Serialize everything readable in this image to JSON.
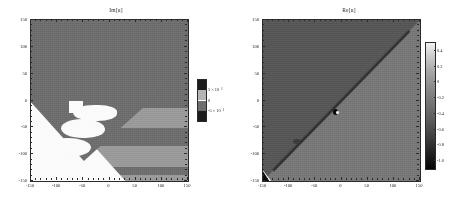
{
  "figure": {
    "background": "#ffffff",
    "panel_count": 2
  },
  "chart_data": [
    {
      "type": "heatmap",
      "title": "Im[u]",
      "xlabel": "",
      "ylabel": "",
      "xlim": [
        -150,
        150
      ],
      "ylim": [
        -150,
        150
      ],
      "xticks": [
        -150,
        -100,
        -50,
        0,
        50,
        100,
        150
      ],
      "yticks": [
        -150,
        -100,
        -50,
        0,
        50,
        100,
        150
      ],
      "xticklabels": [
        "-150",
        "-100",
        "-50",
        "0",
        "50",
        "100",
        "150"
      ],
      "yticklabels": [
        "-150",
        "-100",
        "-50",
        "0",
        "50",
        "100",
        "150"
      ],
      "grid": false,
      "colormap": "grayscale",
      "colorbar": {
        "position": "right",
        "discrete": true,
        "ticklabels": [
          "5 × 10⁻⁶",
          "0",
          "-5 × 10⁻⁶"
        ],
        "tickvalues": [
          5e-06,
          0,
          -5e-06
        ],
        "segments": [
          "#1c1c1c",
          "#b4b4b4",
          "#6e6e6e",
          "#1c1c1c"
        ]
      },
      "zlim": [
        -5e-06,
        5e-06
      ],
      "description": "Imaginary part of u: mostly uniform mid-gray background with a bright white diagonal stripe running lower-left to upper-right, lighter horizontal bands in the lower half, and lobed white islands along the diagonal below y = -10.",
      "regions": [
        {
          "name": "background",
          "value": 0,
          "color": "#6e6e6e"
        },
        {
          "name": "white-diagonal-stripe",
          "value": 5e-06,
          "color": "#fbfbfb"
        },
        {
          "name": "light-horizontal-band",
          "value": 2.5e-06,
          "color": "#9a9a9a"
        },
        {
          "name": "white-lobes",
          "value": 5e-06,
          "color": "#fbfbfb"
        }
      ]
    },
    {
      "type": "heatmap",
      "title": "Re[u]",
      "xlabel": "",
      "ylabel": "",
      "xlim": [
        -150,
        150
      ],
      "ylim": [
        -150,
        150
      ],
      "xticks": [
        -150,
        -100,
        -50,
        0,
        50,
        100,
        150
      ],
      "yticks": [
        -150,
        -100,
        -50,
        0,
        50,
        100,
        150
      ],
      "xticklabels": [
        "-150",
        "-100",
        "-50",
        "0",
        "50",
        "100",
        "150"
      ],
      "yticklabels": [
        "-150",
        "-100",
        "-50",
        "0",
        "50",
        "100",
        "150"
      ],
      "grid": false,
      "colormap": "grayscale",
      "colorbar": {
        "position": "right",
        "discrete": false,
        "ticklabels": [
          "0.4",
          "0.2",
          "0",
          "-0.2",
          "-0.4",
          "-0.6",
          "-0.8",
          "-1.0"
        ],
        "tickvalues": [
          0.4,
          0.2,
          0,
          -0.2,
          -0.4,
          -0.6,
          -0.8,
          -1.0
        ],
        "gradient_top": "#f2f2f2",
        "gradient_bottom": "#050505"
      },
      "zlim": [
        -1.0,
        0.5
      ],
      "description": "Real part of u: the square is split by the main diagonal; the upper-left half is darker gray (about -0.35) and the lower-right half is lighter gray (about -0.15), with a thin dark caustic line along the diagonal, a small dark/white singularity near (-15,-12), and a bright notch at the lower-left corner (-150,-145).",
      "regions": [
        {
          "name": "upper-left-half",
          "value": -0.35,
          "color": "#575757"
        },
        {
          "name": "lower-right-half",
          "value": -0.15,
          "color": "#787878"
        },
        {
          "name": "diagonal-caustic",
          "value": -0.75,
          "color": "#2e2e2e"
        },
        {
          "name": "singularity-spot",
          "value": -1.0,
          "color": "#0a0a0a"
        },
        {
          "name": "corner-flash",
          "value": 0.45,
          "color": "#f4f4f4"
        }
      ]
    }
  ]
}
